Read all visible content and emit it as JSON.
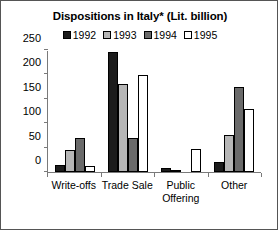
{
  "chart_data": {
    "type": "bar",
    "title": "Dispositions in Italy* (Lit. billion)",
    "xlabel": "",
    "ylabel": "",
    "ylim": [
      0,
      250
    ],
    "yticks": [
      0,
      50,
      100,
      150,
      200,
      250
    ],
    "ytick_labels": [
      "0",
      "50",
      "100",
      "150",
      "200",
      "250"
    ],
    "grid": false,
    "legend_position": "top-center",
    "categories": [
      "Write-offs",
      "Trade Sale",
      "Public Offering",
      "Other"
    ],
    "category_lines": [
      [
        "Write-offs"
      ],
      [
        "Trade Sale"
      ],
      [
        "Public",
        "Offering"
      ],
      [
        "Other"
      ]
    ],
    "series": [
      {
        "name": "1992",
        "color": "#1c1c1c",
        "values": [
          15,
          245,
          8,
          21
        ]
      },
      {
        "name": "1993",
        "color": "#b6b6b6",
        "values": [
          45,
          180,
          1,
          76
        ]
      },
      {
        "name": "1994",
        "color": "#6a6a6a",
        "values": [
          70,
          70,
          0,
          175
        ]
      },
      {
        "name": "1995",
        "color": "#ffffff",
        "values": [
          13,
          198,
          47,
          129
        ]
      }
    ]
  },
  "legend": {
    "items": [
      {
        "label": "1992"
      },
      {
        "label": "1993"
      },
      {
        "label": "1994"
      },
      {
        "label": "1995"
      }
    ]
  },
  "axis": {
    "y_labels": [
      "250",
      "200",
      "150",
      "100",
      "50",
      "0"
    ]
  }
}
